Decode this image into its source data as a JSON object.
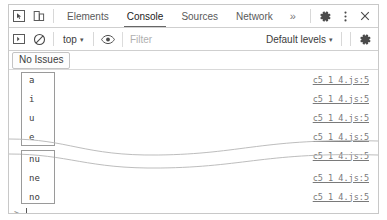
{
  "window": {
    "title": "Chrome DevTools Console"
  },
  "toolbar_top": {
    "icons": [
      {
        "name": "inspect-element-icon",
        "label": "Inspect element"
      },
      {
        "name": "device-toolbar-icon",
        "label": "Toggle device toolbar"
      }
    ],
    "tabs": [
      {
        "label": "Elements",
        "active": false
      },
      {
        "label": "Console",
        "active": true
      },
      {
        "label": "Sources",
        "active": false
      },
      {
        "label": "Network",
        "active": false
      }
    ],
    "overflow_label": "»",
    "right_icons": [
      {
        "name": "settings-gear-icon",
        "label": "Settings"
      },
      {
        "name": "more-options-icon",
        "label": "More options"
      },
      {
        "name": "close-icon",
        "label": "Close"
      }
    ]
  },
  "toolbar_filter": {
    "sidebar_toggle_name": "console-sidebar-icon",
    "clear_console_name": "clear-console-icon",
    "context_value": "top",
    "context_caret": "▾",
    "eye_icon_name": "live-expression-eye-icon",
    "filter_placeholder": "Filter",
    "levels_value": "Default levels",
    "levels_caret": "▾",
    "settings_icon_name": "console-settings-gear-icon"
  },
  "issues_bar": {
    "label": "No Issues"
  },
  "console": {
    "source_link": "c5_1_4.js:5",
    "group_top": {
      "messages": [
        "a",
        "i",
        "u",
        "e"
      ],
      "partial_message": ""
    },
    "group_bottom": {
      "messages": [
        "nu",
        "ne",
        "no"
      ]
    },
    "prompt": {
      "caret": ">"
    }
  },
  "colors": {
    "panel_border": "#c8c8c8",
    "toolbar_border": "#cfcfcf",
    "text_primary": "#3a3a3a",
    "text_muted": "#7a7a7a",
    "placeholder": "#b0b0b0",
    "bracket": "#9a9a9a",
    "tear_line": "#b5b5b5"
  }
}
